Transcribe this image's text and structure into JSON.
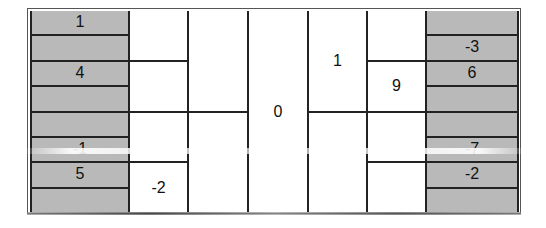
{
  "diagram": {
    "columns": [
      {
        "name": "col-1",
        "shaded": true,
        "width": 98,
        "cells": [
          "1",
          "",
          "4",
          "",
          "",
          "-1",
          "5",
          ""
        ]
      },
      {
        "name": "col-2",
        "shaded": false,
        "width": 59,
        "cells": [
          "",
          "",
          "",
          "-2"
        ]
      },
      {
        "name": "col-3",
        "shaded": false,
        "width": 60,
        "cells": [
          "",
          ""
        ]
      },
      {
        "name": "col-4",
        "shaded": false,
        "width": 60,
        "cells": [
          "0"
        ]
      },
      {
        "name": "col-5",
        "shaded": false,
        "width": 59,
        "cells": [
          "1",
          ""
        ]
      },
      {
        "name": "col-6",
        "shaded": false,
        "width": 59,
        "cells": [
          "",
          "9",
          "",
          ""
        ]
      },
      {
        "name": "col-7",
        "shaded": true,
        "width": 94,
        "cells": [
          "",
          "-3",
          "6",
          "",
          "",
          "-7",
          "-2",
          ""
        ]
      }
    ]
  }
}
